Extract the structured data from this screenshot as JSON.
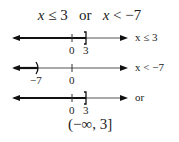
{
  "title": {
    "left_var": "x",
    "left_rest": " ≤ 3",
    "connector": "   or   ",
    "right_var": "x",
    "right_rest": " < −7"
  },
  "number_lines": [
    {
      "label": "x ≤ 3",
      "ticks": [
        {
          "value": "0"
        },
        {
          "value": "3"
        }
      ],
      "endpoint": "]",
      "shaded": "left of 3"
    },
    {
      "label": "x < −7",
      "ticks": [
        {
          "value": "−7"
        },
        {
          "value": "0"
        }
      ],
      "endpoint": ")",
      "shaded": "left of −7"
    },
    {
      "label": "or",
      "ticks": [
        {
          "value": "0"
        },
        {
          "value": "3"
        }
      ],
      "endpoint": "]",
      "shaded": "left of 3"
    }
  ],
  "interval_notation": "(−∞, 3]",
  "colors": {
    "line": "#333333",
    "shade": "#111111"
  }
}
